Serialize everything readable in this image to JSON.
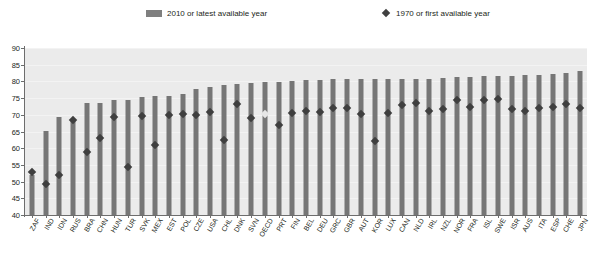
{
  "legend": {
    "bars_label": "2010 or latest available year",
    "diamond_label": "1970 or first available year",
    "bar_color": "#7f7f7f",
    "diamond_color": "#404040"
  },
  "chart_data": {
    "type": "bar",
    "title": "",
    "xlabel": "",
    "ylabel": "",
    "ylim": [
      40,
      90
    ],
    "ytick_step": 5,
    "yticks": [
      40,
      45,
      50,
      55,
      60,
      65,
      70,
      75,
      80,
      85,
      90
    ],
    "grid": true,
    "legend_position": "top",
    "highlight_category": "OECD",
    "categories": [
      "ZAF",
      "IND",
      "IDN",
      "RUS",
      "BRA",
      "CHN",
      "HUN",
      "TUR",
      "SVK",
      "MEX",
      "EST",
      "POL",
      "CZE",
      "USA",
      "CHL",
      "DNK",
      "SVN",
      "OECD",
      "PRT",
      "FIN",
      "BEL",
      "DEU",
      "GRC",
      "GBR",
      "AUT",
      "KOR",
      "LUX",
      "CAN",
      "NLD",
      "IRL",
      "NZL",
      "NOR",
      "FRA",
      "ISL",
      "SWE",
      "ISR",
      "AUS",
      "ITA",
      "ESP",
      "CHE",
      "JPN"
    ],
    "series": [
      {
        "name": "2010 or latest available year",
        "type": "bar",
        "values": [
          52.0,
          65.3,
          69.2,
          68.6,
          73.4,
          73.4,
          74.5,
          74.4,
          75.2,
          75.5,
          75.7,
          76.3,
          77.7,
          78.2,
          78.8,
          79.1,
          79.5,
          79.8,
          79.8,
          80.2,
          80.3,
          80.5,
          80.6,
          80.6,
          80.7,
          80.7,
          80.7,
          80.8,
          80.8,
          80.8,
          81.0,
          81.2,
          81.3,
          81.5,
          81.5,
          81.6,
          81.8,
          82.0,
          82.2,
          82.6,
          83.0
        ]
      },
      {
        "name": "1970 or first available year",
        "type": "scatter-diamond",
        "values": [
          53.0,
          49.3,
          52.0,
          68.5,
          59.0,
          63.0,
          69.2,
          54.3,
          69.5,
          61.0,
          70.0,
          70.1,
          70.0,
          70.8,
          62.5,
          73.3,
          69.0,
          70.3,
          67.0,
          70.4,
          71.0,
          70.7,
          72.0,
          71.9,
          70.3,
          62.3,
          70.4,
          72.9,
          73.6,
          71.2,
          71.6,
          74.3,
          72.2,
          74.3,
          74.7,
          71.6,
          71.0,
          72.0,
          72.4,
          73.2,
          72.0
        ]
      }
    ]
  }
}
